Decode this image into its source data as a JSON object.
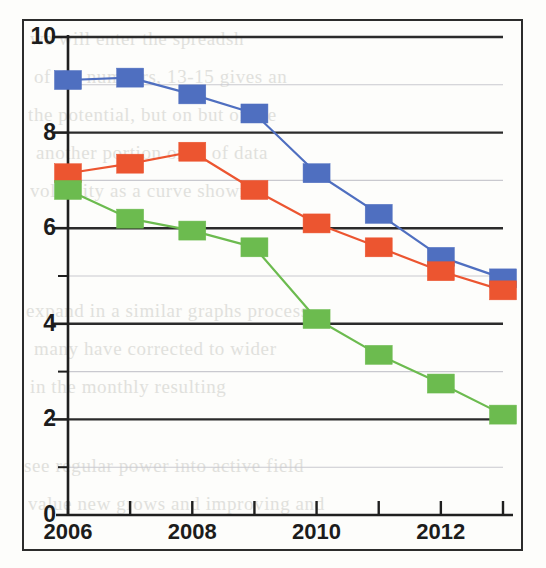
{
  "figure": {
    "background_color": "#fdfdfb",
    "frame_color": "#2c2c2c",
    "gridline_major_color": "#2b2b2b",
    "gridline_minor_color": "#c9c9cf"
  },
  "ghost_text": {
    "lines": [
      "we will enter the spreadsh",
      "of the numbers, 13-15 gives an",
      "the potential, but on but of the",
      "another portion or or of data",
      "volatility as a curve shown",
      "expand in a similar graphs process",
      "many have corrected to wider",
      "in the monthly resulting",
      "see regular power into active field",
      "value new grows and improving and"
    ]
  },
  "chart_data": {
    "type": "line",
    "title": "",
    "subtitle": "",
    "xlabel": "",
    "ylabel": "",
    "x": [
      2006,
      2007,
      2008,
      2009,
      2010,
      2011,
      2012,
      2013
    ],
    "categories": [
      "2006",
      "2007",
      "2008",
      "2009",
      "2010",
      "2011",
      "2012",
      "2013"
    ],
    "xlim": [
      2006,
      2013
    ],
    "ylim": [
      0,
      10
    ],
    "xtick_values": [
      2006,
      2007,
      2008,
      2009,
      2010,
      2011,
      2012,
      2013
    ],
    "xtick_labels_shown": [
      "2006",
      "",
      "2008",
      "",
      "2010",
      "",
      "2012",
      ""
    ],
    "ytick_values": [
      0,
      1,
      2,
      3,
      4,
      5,
      6,
      7,
      8,
      9,
      10
    ],
    "ytick_labels_shown": [
      "0",
      "",
      "2",
      "",
      "4",
      "",
      "6",
      "",
      "8",
      "",
      "10"
    ],
    "ytick_major": [
      0,
      2,
      4,
      6,
      8,
      10
    ],
    "ytick_minor": [
      1,
      3,
      5,
      7,
      9
    ],
    "grid": true,
    "legend": false,
    "legend_position": "none",
    "marker": "square",
    "series": [
      {
        "name": "blue-series",
        "color": "#4f6fc0",
        "values": [
          9.1,
          9.15,
          8.8,
          8.4,
          7.15,
          6.3,
          5.4,
          4.95
        ]
      },
      {
        "name": "red-series",
        "color": "#ec5530",
        "values": [
          7.15,
          7.35,
          7.6,
          6.8,
          6.1,
          5.6,
          5.1,
          4.7
        ]
      },
      {
        "name": "green-series",
        "color": "#6cbb4f",
        "values": [
          6.8,
          6.2,
          5.95,
          5.6,
          4.1,
          3.35,
          2.75,
          2.1
        ]
      }
    ]
  },
  "axes": {
    "y_labels": [
      "10",
      "8",
      "6",
      "4",
      "2",
      "0"
    ],
    "x_labels": [
      "2006",
      "2008",
      "2010",
      "2012"
    ]
  }
}
